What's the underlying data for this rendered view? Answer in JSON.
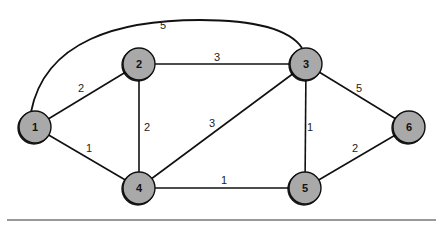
{
  "diagram": {
    "type": "weighted-undirected-graph",
    "colors": {
      "node_fill": "#a9a9a9",
      "node_stroke": "#111111",
      "edge": "#111111",
      "background": "#ffffff",
      "rule": "#333333"
    },
    "nodes": [
      {
        "id": "1",
        "label": "1",
        "x": 35,
        "y": 127
      },
      {
        "id": "2",
        "label": "2",
        "x": 139,
        "y": 64
      },
      {
        "id": "3",
        "label": "3",
        "x": 306,
        "y": 64
      },
      {
        "id": "4",
        "label": "4",
        "x": 139,
        "y": 188
      },
      {
        "id": "5",
        "label": "5",
        "x": 305,
        "y": 188
      },
      {
        "id": "6",
        "label": "6",
        "x": 409,
        "y": 127
      }
    ],
    "edges": [
      {
        "from": "1",
        "to": "3",
        "weight": "5",
        "curved": true,
        "label_x": 163,
        "label_y": 29
      },
      {
        "from": "1",
        "to": "2",
        "weight": "2",
        "label_x": 81,
        "label_y": 92
      },
      {
        "from": "2",
        "to": "3",
        "weight": "3",
        "label_x": 217,
        "label_y": 61
      },
      {
        "from": "3",
        "to": "6",
        "weight": "5",
        "label_x": 359,
        "label_y": 92
      },
      {
        "from": "2",
        "to": "4",
        "weight": "2",
        "label_x": 144,
        "label_y": 131
      },
      {
        "from": "4",
        "to": "3",
        "weight": "3",
        "label_x": 210,
        "label_y": 128
      },
      {
        "from": "3",
        "to": "5",
        "weight": "1",
        "label_x": 309,
        "label_y": 131
      },
      {
        "from": "1",
        "to": "4",
        "weight": "1",
        "label_x": 86,
        "label_y": 152
      },
      {
        "from": "4",
        "to": "5",
        "weight": "1",
        "label_x": 222,
        "label_y": 184
      },
      {
        "from": "5",
        "to": "6",
        "weight": "2",
        "label_x": 352,
        "label_y": 153
      }
    ]
  }
}
